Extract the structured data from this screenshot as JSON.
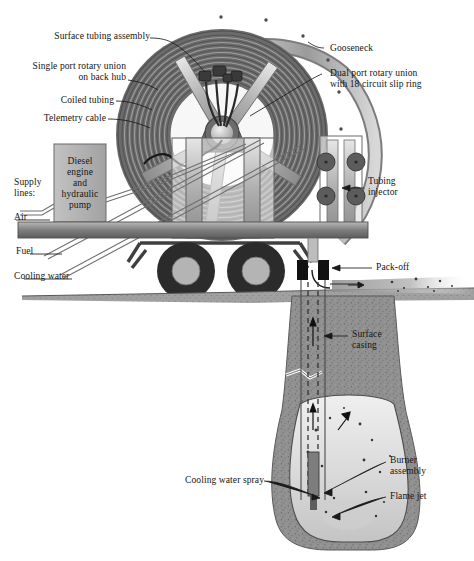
{
  "figure": {
    "type": "technical-cutaway-diagram",
    "palette": {
      "background": "#ffffff",
      "ink": "#141414",
      "reel_dark": "#6e6e6e",
      "reel_mid": "#8d8d8d",
      "metal_light": "#c9c9c9",
      "metal_mid": "#a8a8a8",
      "tire_dark": "#2b2b2b",
      "hub_gray": "#b4b4b4",
      "ground_gray": "#9a9a9a",
      "rock_gray": "#8f8f8f",
      "cavern_light": "#dedede"
    }
  },
  "labels": {
    "surface_tubing_assembly": "Surface tubing assembly",
    "single_port_rotary_union": "Single port rotary union\non back hub",
    "coiled_tubing": "Coiled tubing",
    "telemetry_cable": "Telemetry cable",
    "gooseneck": "Gooseneck",
    "dual_port_rotary_union": "Dual port rotary union\nwith 18 circuit slip ring",
    "supply_lines": "Supply\nlines:",
    "air": "Air",
    "fuel": "Fuel",
    "cooling_water": "Cooling water",
    "diesel_engine": "Diesel\nengine\nand\nhydraulic\npump",
    "tubing_injector": "Tubing\ninjector",
    "pack_off": "Pack-off",
    "surface_casing": "Surface\ncasing",
    "cooling_water_spray": "Cooling water spray",
    "burner_assembly": "Burner\nassembly",
    "flame_jet": "Flame jet"
  },
  "components": {
    "reel": "coiled-tubing-reel",
    "gooseneck_arc": "gooseneck-arc",
    "injector": "tubing-injector-rollers",
    "trailer": "trailer-deck-and-wheels",
    "engine_box": "diesel-engine-hydraulic-pump",
    "wellbore": "wellbore-with-surface-casing",
    "cavern": "downhole-cavern",
    "burner": "burner-assembly-tool",
    "returns_jet": "surface-returns-debris-jet"
  }
}
